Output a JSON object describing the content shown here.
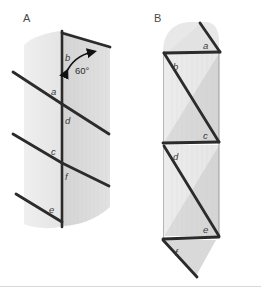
{
  "figure": {
    "background_color": "#ffffff",
    "ink_color": "#2b2b2b",
    "panels": [
      {
        "id": "A",
        "label": "A",
        "description": "folded-curved-sheet",
        "fill_light": "#ebebeb",
        "fill_dark": "#d7d7d7",
        "creases": [
          {
            "name": "a",
            "label": "a"
          },
          {
            "name": "b",
            "label": "b"
          },
          {
            "name": "c",
            "label": "c"
          },
          {
            "name": "d",
            "label": "d"
          },
          {
            "name": "e",
            "label": "e"
          },
          {
            "name": "f",
            "label": "f"
          }
        ],
        "annotations": [
          {
            "name": "fold-angle",
            "label": "60°"
          }
        ]
      },
      {
        "id": "B",
        "label": "B",
        "description": "unfolded-flat-pattern",
        "fill_light": "#ededed",
        "fill_dark": "#dcdcdc",
        "creases": [
          {
            "name": "a",
            "label": "a"
          },
          {
            "name": "b",
            "label": "b"
          },
          {
            "name": "c",
            "label": "c"
          },
          {
            "name": "d",
            "label": "d"
          },
          {
            "name": "e",
            "label": "e"
          },
          {
            "name": "f",
            "label": "f"
          }
        ]
      }
    ],
    "baseline": {
      "name": "bottom-rule",
      "color": "#d8d8d8"
    }
  }
}
